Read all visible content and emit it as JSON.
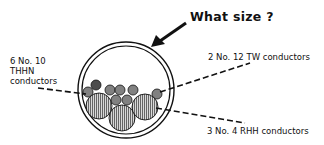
{
  "title": "What size ?",
  "labels": {
    "thhn": {
      "line1": "6 No. 10",
      "line2": "THHN",
      "line3": "conductors"
    },
    "tw": "2 No. 12 TW conductors",
    "rhh": "3 No. 4 RHH conductors"
  },
  "conduit": {
    "center": [
      126,
      90
    ],
    "outer_radius": 48,
    "inner_radius": 44
  },
  "conductors": {
    "rhh": {
      "count": 3,
      "size": "No. 4",
      "type": "RHH",
      "hatch": "vertical"
    },
    "thhn": {
      "count": 6,
      "size": "No. 10",
      "type": "THHN",
      "hatch": "crosshatch"
    },
    "tw": {
      "count": 2,
      "size": "No. 12",
      "type": "TW",
      "hatch": "dense"
    }
  },
  "colors": {
    "ink": "#111111",
    "background": "#ffffff",
    "fill": "#9a9a9a"
  }
}
